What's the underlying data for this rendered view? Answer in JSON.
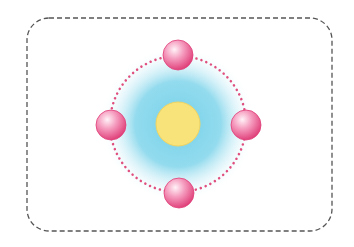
{
  "diagram": {
    "type": "atom-model",
    "frame": {
      "x": 27,
      "y": 18,
      "width": 305,
      "height": 213,
      "radius": 22,
      "stroke": "#555555",
      "dash": "5 3"
    },
    "nucleus": {
      "cx": 178,
      "cy": 124,
      "r": 22,
      "color": "#f8e27a",
      "stroke": "#f2d45e"
    },
    "cloud": {
      "cx": 178,
      "cy": 124,
      "r": 78,
      "inner_color": "#6fcfe8",
      "outer_color": "#ffffff"
    },
    "orbit": {
      "cx": 178,
      "cy": 124,
      "r": 68,
      "color": "#e0507e",
      "dot_size": 1.6,
      "dot_spacing": 5.2
    },
    "electrons": [
      {
        "name": "electron-top",
        "cx": 178,
        "cy": 55,
        "r": 15
      },
      {
        "name": "electron-right",
        "cx": 246,
        "cy": 125,
        "r": 15
      },
      {
        "name": "electron-bottom",
        "cx": 179,
        "cy": 193,
        "r": 15
      },
      {
        "name": "electron-left",
        "cx": 111,
        "cy": 125,
        "r": 15
      }
    ],
    "electron_colors": {
      "highlight": "#fff2f7",
      "mid": "#f59bbd",
      "edge": "#df3f78"
    }
  }
}
